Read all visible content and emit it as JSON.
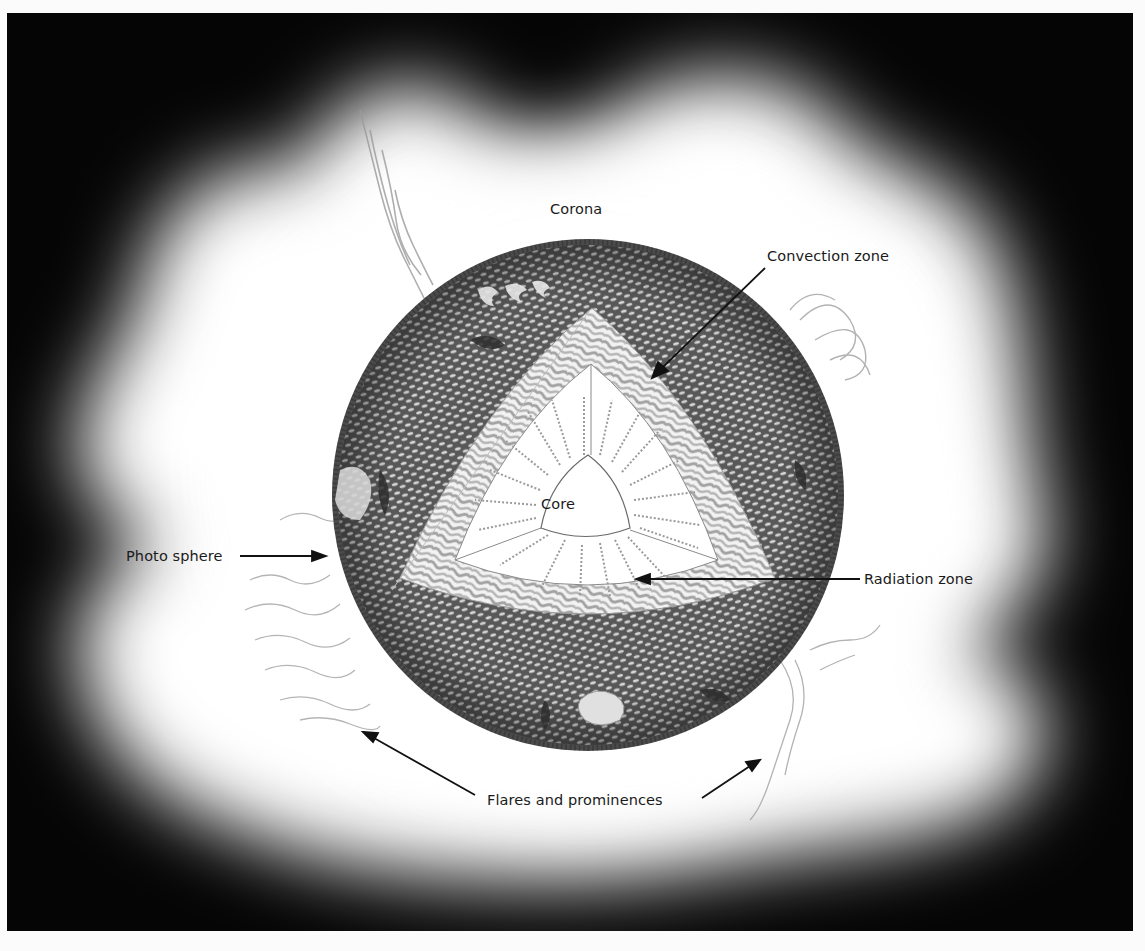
{
  "diagram": {
    "colors": {
      "background": "#050505",
      "corona": "#ffffff",
      "surface": "#5e5e5e",
      "convection_band": "#a9a9a9",
      "radiation_zone": "#ffffff",
      "label_text": "#1a1a1a"
    },
    "labels": {
      "corona": "Corona",
      "convection_zone": "Convection zone",
      "core": "Core",
      "photosphere": "Photo sphere",
      "radiation_zone": "Radiation zone",
      "flares": "Flares and prominences"
    },
    "layers": [
      {
        "name": "Core",
        "position": "center"
      },
      {
        "name": "Radiation zone",
        "position": "inner triangle with wavy radiating lines"
      },
      {
        "name": "Convection zone",
        "position": "textured band around radiation zone"
      },
      {
        "name": "Photo sphere",
        "position": "granulated outer surface"
      },
      {
        "name": "Corona",
        "position": "white glow surrounding the sphere"
      },
      {
        "name": "Flares and prominences",
        "position": "wispy structures at the limb"
      }
    ]
  }
}
